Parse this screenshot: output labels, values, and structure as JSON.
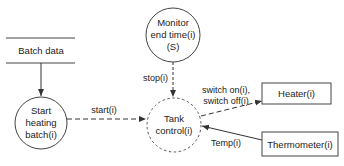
{
  "diagram": {
    "data_store": {
      "label": "Batch data"
    },
    "processes": {
      "start": {
        "lines": [
          "Start",
          "heating",
          "batch(i)"
        ]
      },
      "monitor": {
        "lines": [
          "Monitor",
          "end time(i)",
          "(S)"
        ]
      },
      "tank": {
        "lines": [
          "Tank",
          "control(i)"
        ]
      }
    },
    "externals": {
      "heater": {
        "label": "Heater(i)"
      },
      "thermometer": {
        "label": "Thermometer(i)"
      }
    },
    "flows": {
      "start": {
        "label": "start(i)"
      },
      "stop": {
        "label": "stop(i)"
      },
      "switch": {
        "lines": [
          "switch on(i),",
          "switch off(i)"
        ]
      },
      "temp": {
        "label": "Temp(i)"
      }
    }
  }
}
